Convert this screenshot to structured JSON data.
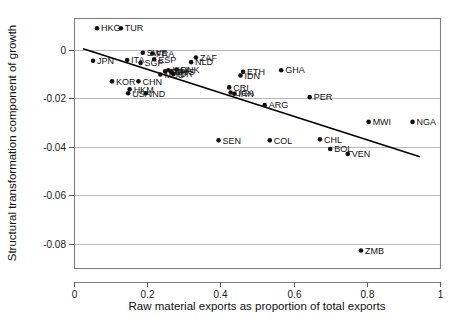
{
  "chart_data": {
    "type": "scatter",
    "title": "",
    "xlabel": "Raw material exports as proportion of total exports",
    "ylabel": "Structural transformation component of growth",
    "xlim": [
      0,
      1
    ],
    "ylim": [
      -0.09,
      0.013
    ],
    "xticks": [
      0,
      0.2,
      0.4,
      0.6,
      0.8,
      1
    ],
    "xticklabels": [
      "0",
      "0.2",
      "0.4",
      "0.6",
      "0.8",
      "1"
    ],
    "yticks": [
      0,
      -0.02,
      -0.04,
      -0.06,
      -0.08
    ],
    "yticklabels": [
      "0",
      "-0.02",
      "-0.04",
      "-0.06",
      "-0.08"
    ],
    "grid": "horizontal",
    "legend": "none",
    "marker": "filled-circle",
    "fit_line": {
      "label": "linear fit",
      "x0": 0.025,
      "y0": 0.0003,
      "x1": 0.945,
      "y1": -0.0442
    },
    "points": [
      {
        "label": "HKG",
        "x": 0.063,
        "y": 0.0088,
        "lp": "right"
      },
      {
        "label": "TUR",
        "x": 0.128,
        "y": 0.0088,
        "lp": "right"
      },
      {
        "label": "SWE",
        "x": 0.188,
        "y": -0.0013,
        "lp": "right"
      },
      {
        "label": "FRA",
        "x": 0.214,
        "y": -0.0016,
        "lp": "right"
      },
      {
        "label": "ESP",
        "x": 0.219,
        "y": -0.004,
        "lp": "right"
      },
      {
        "label": "ITA",
        "x": 0.145,
        "y": -0.0043,
        "lp": "right"
      },
      {
        "label": "SGP",
        "x": 0.182,
        "y": -0.0055,
        "lp": "right"
      },
      {
        "label": "JPN",
        "x": 0.052,
        "y": -0.0046,
        "lp": "right"
      },
      {
        "label": "ZAF",
        "x": 0.333,
        "y": -0.0033,
        "lp": "right"
      },
      {
        "label": "NLD",
        "x": 0.32,
        "y": -0.0052,
        "lp": "right"
      },
      {
        "label": "DNK",
        "x": 0.28,
        "y": -0.0082,
        "lp": "right"
      },
      {
        "label": "LKA",
        "x": 0.258,
        "y": -0.0085,
        "lp": "right"
      },
      {
        "label": "MYS",
        "x": 0.266,
        "y": -0.0093,
        "lp": "right"
      },
      {
        "label": "TUN",
        "x": 0.249,
        "y": -0.009,
        "lp": "right"
      },
      {
        "label": "MUS",
        "x": 0.236,
        "y": -0.0103,
        "lp": "right"
      },
      {
        "label": "ISR",
        "x": 0.272,
        "y": -0.0101,
        "lp": "right"
      },
      {
        "label": "KOR",
        "x": 0.104,
        "y": -0.0131,
        "lp": "right"
      },
      {
        "label": "CHN",
        "x": 0.176,
        "y": -0.0131,
        "lp": "right"
      },
      {
        "label": "HKM",
        "x": 0.152,
        "y": -0.0164,
        "lp": "right"
      },
      {
        "label": "USA",
        "x": 0.148,
        "y": -0.018,
        "lp": "right"
      },
      {
        "label": "IND",
        "x": 0.196,
        "y": -0.018,
        "lp": "right"
      },
      {
        "label": "ETH",
        "x": 0.462,
        "y": -0.0092,
        "lp": "right"
      },
      {
        "label": "IDN",
        "x": 0.455,
        "y": -0.0107,
        "lp": "right"
      },
      {
        "label": "CRI",
        "x": 0.424,
        "y": -0.0156,
        "lp": "right"
      },
      {
        "label": "IRN",
        "x": 0.438,
        "y": -0.0182,
        "lp": "right"
      },
      {
        "label": "UGA",
        "x": 0.428,
        "y": -0.0177,
        "lp": "right"
      },
      {
        "label": "GHA",
        "x": 0.566,
        "y": -0.0085,
        "lp": "right"
      },
      {
        "label": "PER",
        "x": 0.644,
        "y": -0.0196,
        "lp": "right"
      },
      {
        "label": "ARG",
        "x": 0.521,
        "y": -0.0229,
        "lp": "right"
      },
      {
        "label": "MWI",
        "x": 0.805,
        "y": -0.0298,
        "lp": "right"
      },
      {
        "label": "NGA",
        "x": 0.925,
        "y": -0.0298,
        "lp": "right"
      },
      {
        "label": "SEN",
        "x": 0.395,
        "y": -0.0374,
        "lp": "right"
      },
      {
        "label": "COL",
        "x": 0.535,
        "y": -0.0374,
        "lp": "right"
      },
      {
        "label": "CHL",
        "x": 0.672,
        "y": -0.037,
        "lp": "right"
      },
      {
        "label": "BOL",
        "x": 0.7,
        "y": -0.041,
        "lp": "right"
      },
      {
        "label": "VEN",
        "x": 0.748,
        "y": -0.043,
        "lp": "right"
      },
      {
        "label": "ZMB",
        "x": 0.784,
        "y": -0.0828,
        "lp": "right"
      }
    ]
  }
}
